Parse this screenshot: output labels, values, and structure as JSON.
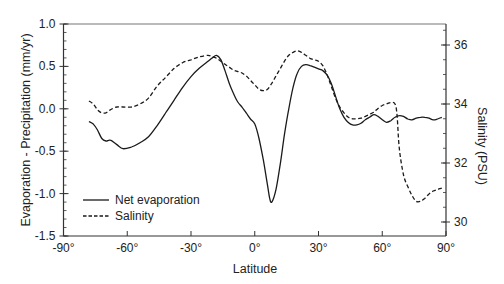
{
  "chart_data": {
    "type": "line",
    "title": "",
    "xlabel": "Latitude",
    "ylabel": "Evaporation - Precipitation  (mm/yr)",
    "y2label": "Salinity (PSU)",
    "xlim": [
      -90,
      90
    ],
    "ylim": [
      -1.5,
      1.0
    ],
    "y2lim": [
      29.6,
      36.8
    ],
    "x_ticks": [
      -90,
      -60,
      -30,
      0,
      30,
      60,
      90
    ],
    "x_tick_labels": [
      "-90°",
      "-60°",
      "-30°",
      "0°",
      "30°",
      "60°",
      "90°"
    ],
    "y_ticks": [
      1.0,
      0.5,
      0.0,
      -0.5,
      -1.0,
      -1.5
    ],
    "y_tick_labels": [
      "1.0",
      "0.5",
      "0.0",
      "-0.5",
      "-1.0",
      "-1.5"
    ],
    "y2_ticks": [
      36,
      34,
      32,
      30
    ],
    "y2_tick_labels": [
      "36",
      "34",
      "32",
      "30"
    ],
    "grid": false,
    "legend_position": "lower left",
    "series": [
      {
        "name": "Net evaporation",
        "axis": "left",
        "style": "solid",
        "x": [
          -78,
          -76,
          -74,
          -72,
          -70,
          -68,
          -65,
          -62,
          -58,
          -54,
          -50,
          -46,
          -42,
          -38,
          -34,
          -30,
          -26,
          -22,
          -20,
          -18,
          -16,
          -14,
          -12,
          -10,
          -8,
          -6,
          -4,
          -2,
          0,
          2,
          4,
          6,
          7,
          8,
          10,
          12,
          14,
          16,
          18,
          20,
          22,
          24,
          26,
          28,
          30,
          32,
          34,
          36,
          38,
          40,
          42,
          44,
          46,
          48,
          50,
          52,
          54,
          56,
          58,
          60,
          62,
          64,
          66,
          68,
          70,
          72,
          74,
          76,
          78,
          80,
          82,
          84,
          86,
          88
        ],
        "values": [
          -0.15,
          -0.18,
          -0.25,
          -0.35,
          -0.38,
          -0.37,
          -0.42,
          -0.47,
          -0.45,
          -0.4,
          -0.33,
          -0.2,
          -0.05,
          0.1,
          0.25,
          0.38,
          0.48,
          0.56,
          0.6,
          0.63,
          0.58,
          0.45,
          0.3,
          0.18,
          0.08,
          0.02,
          -0.05,
          -0.12,
          -0.18,
          -0.35,
          -0.6,
          -0.9,
          -1.05,
          -1.1,
          -0.95,
          -0.65,
          -0.3,
          0.0,
          0.25,
          0.42,
          0.5,
          0.52,
          0.51,
          0.49,
          0.47,
          0.45,
          0.4,
          0.3,
          0.15,
          0.0,
          -0.1,
          -0.16,
          -0.19,
          -0.19,
          -0.17,
          -0.13,
          -0.1,
          -0.07,
          -0.09,
          -0.13,
          -0.16,
          -0.14,
          -0.1,
          -0.08,
          -0.09,
          -0.12,
          -0.13,
          -0.11,
          -0.1,
          -0.1,
          -0.11,
          -0.13,
          -0.12,
          -0.1
        ]
      },
      {
        "name": "Salinity",
        "axis": "right",
        "style": "dashed",
        "x": [
          -78,
          -76,
          -74,
          -72,
          -70,
          -68,
          -65,
          -62,
          -58,
          -54,
          -50,
          -46,
          -42,
          -38,
          -34,
          -30,
          -26,
          -22,
          -20,
          -18,
          -16,
          -14,
          -12,
          -10,
          -8,
          -6,
          -4,
          -2,
          0,
          2,
          4,
          6,
          8,
          10,
          12,
          14,
          16,
          18,
          20,
          22,
          24,
          26,
          28,
          30,
          32,
          34,
          36,
          38,
          40,
          42,
          44,
          46,
          48,
          50,
          52,
          54,
          56,
          58,
          60,
          62,
          64,
          66,
          67,
          68,
          70,
          72,
          74,
          76,
          78,
          80,
          82,
          84,
          86,
          88
        ],
        "values": [
          34.1,
          34.0,
          33.8,
          33.7,
          33.7,
          33.8,
          33.9,
          33.9,
          33.9,
          34.0,
          34.2,
          34.6,
          34.9,
          35.2,
          35.4,
          35.5,
          35.6,
          35.65,
          35.6,
          35.55,
          35.45,
          35.35,
          35.25,
          35.15,
          35.1,
          35.05,
          34.95,
          34.8,
          34.65,
          34.5,
          34.45,
          34.5,
          34.7,
          34.95,
          35.2,
          35.45,
          35.65,
          35.75,
          35.8,
          35.75,
          35.65,
          35.55,
          35.5,
          35.45,
          35.3,
          35.0,
          34.6,
          34.2,
          33.9,
          33.7,
          33.55,
          33.5,
          33.5,
          33.52,
          33.58,
          33.65,
          33.72,
          33.85,
          33.95,
          34.0,
          34.05,
          34.0,
          33.6,
          32.5,
          31.6,
          31.2,
          30.9,
          30.7,
          30.7,
          30.8,
          30.95,
          31.05,
          31.1,
          31.15
        ]
      }
    ],
    "legend": [
      {
        "label": "Net evaporation",
        "style": "solid"
      },
      {
        "label": "Salinity",
        "style": "dashed"
      }
    ],
    "colors": {
      "line": "#1a1a1a",
      "axis": "#333333"
    }
  }
}
